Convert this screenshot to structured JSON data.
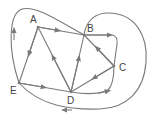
{
  "diagram": {
    "type": "directed-graph",
    "colors": {
      "edge": "#7a7a7a",
      "label": "#444444",
      "background": "#ffffff"
    },
    "nodes": [
      {
        "id": "A",
        "label": "A",
        "x": 38,
        "y": 27
      },
      {
        "id": "B",
        "label": "B",
        "x": 84,
        "y": 35
      },
      {
        "id": "C",
        "label": "C",
        "x": 114,
        "y": 66
      },
      {
        "id": "D",
        "label": "D",
        "x": 71,
        "y": 92
      },
      {
        "id": "E",
        "label": "E",
        "x": 19,
        "y": 83
      }
    ],
    "edges": [
      {
        "from": "A",
        "to": "B",
        "shape": "straight"
      },
      {
        "from": "A",
        "to": "E",
        "shape": "straight"
      },
      {
        "from": "D",
        "to": "A",
        "shape": "straight"
      },
      {
        "from": "D",
        "to": "B",
        "shape": "straight"
      },
      {
        "from": "C",
        "to": "B",
        "shape": "straight"
      },
      {
        "from": "C",
        "to": "D",
        "shape": "straight"
      },
      {
        "from": "E",
        "to": "D",
        "shape": "straight"
      },
      {
        "from": "B",
        "to": "C",
        "shape": "bent-right"
      },
      {
        "from": "D",
        "to": "C",
        "shape": "curved-below"
      },
      {
        "from": "E",
        "to": "B",
        "shape": "loop-left-top"
      },
      {
        "from": "B",
        "to": "E",
        "shape": "loop-right-bottom"
      }
    ]
  }
}
